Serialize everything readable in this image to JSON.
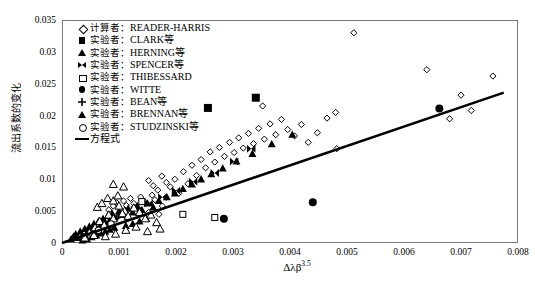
{
  "chart_data": {
    "type": "scatter",
    "title": "",
    "xlabel": "Δλβ",
    "xlabel_exponent": "3.5",
    "ylabel": "流出系数的变化",
    "xlim": [
      0,
      0.008
    ],
    "ylim": [
      0,
      0.035
    ],
    "xticks": [
      "0",
      "0.001",
      "0.002",
      "0.003",
      "0.004",
      "0.005",
      "0.006",
      "0.007",
      "0.008"
    ],
    "yticks": [
      "0",
      "0.005",
      "0.01",
      "0.015",
      "0.02",
      "0.025",
      "0.03",
      "0.035"
    ],
    "grid": false,
    "legend_position": "top-left-inside",
    "series": [
      {
        "name": "READER-HARRIS",
        "role_label": "计算者",
        "marker": "diamond-open",
        "points": [
          [
            0.00082,
            0.0052
          ],
          [
            0.0009,
            0.0058
          ],
          [
            0.00096,
            0.0063
          ],
          [
            0.00103,
            0.005
          ],
          [
            0.00108,
            0.0066
          ],
          [
            0.00113,
            0.0059
          ],
          [
            0.0012,
            0.007
          ],
          [
            0.00126,
            0.0062
          ],
          [
            0.00132,
            0.0055
          ],
          [
            0.00138,
            0.0072
          ],
          [
            0.00145,
            0.0065
          ],
          [
            0.00152,
            0.0048
          ],
          [
            0.00158,
            0.0075
          ],
          [
            0.00163,
            0.0068
          ],
          [
            0.0017,
            0.0045
          ],
          [
            0.00176,
            0.0058
          ],
          [
            0.00152,
            0.0098
          ],
          [
            0.0016,
            0.009
          ],
          [
            0.00168,
            0.0083
          ],
          [
            0.00175,
            0.0105
          ],
          [
            0.00183,
            0.0095
          ],
          [
            0.0019,
            0.0088
          ],
          [
            0.00198,
            0.01
          ],
          [
            0.00205,
            0.0078
          ],
          [
            0.00213,
            0.0112
          ],
          [
            0.00221,
            0.0093
          ],
          [
            0.00228,
            0.0122
          ],
          [
            0.00236,
            0.0106
          ],
          [
            0.00244,
            0.0131
          ],
          [
            0.00252,
            0.0118
          ],
          [
            0.0026,
            0.0143
          ],
          [
            0.00268,
            0.0127
          ],
          [
            0.00276,
            0.015
          ],
          [
            0.00285,
            0.0136
          ],
          [
            0.00294,
            0.0158
          ],
          [
            0.00302,
            0.0142
          ],
          [
            0.0031,
            0.0165
          ],
          [
            0.00318,
            0.0149
          ],
          [
            0.00327,
            0.0172
          ],
          [
            0.00336,
            0.0156
          ],
          [
            0.00345,
            0.018
          ],
          [
            0.00355,
            0.0163
          ],
          [
            0.00365,
            0.0187
          ],
          [
            0.00375,
            0.017
          ],
          [
            0.00385,
            0.0194
          ],
          [
            0.00396,
            0.0178
          ],
          [
            0.00408,
            0.0168
          ],
          [
            0.0042,
            0.0186
          ],
          [
            0.00432,
            0.0158
          ],
          [
            0.00448,
            0.0173
          ],
          [
            0.00465,
            0.0196
          ],
          [
            0.00482,
            0.0148
          ],
          [
            0.00512,
            0.033
          ],
          [
            0.0064,
            0.0272
          ],
          [
            0.0068,
            0.0195
          ],
          [
            0.007,
            0.0232
          ],
          [
            0.00718,
            0.0208
          ],
          [
            0.00756,
            0.0262
          ],
          [
            0.0048,
            0.0205
          ],
          [
            0.00352,
            0.0215
          ]
        ]
      },
      {
        "name": "CLARK等",
        "role_label": "实验者",
        "marker": "square-filled",
        "points": [
          [
            0.00256,
            0.0212
          ],
          [
            0.0034,
            0.0228
          ]
        ]
      },
      {
        "name": "HERNING等",
        "role_label": "实验者",
        "marker": "triangle-filled",
        "points": [
          [
            0.00016,
            0.0006
          ],
          [
            0.0002,
            0.001
          ],
          [
            0.00024,
            0.0014
          ],
          [
            0.00028,
            0.0008
          ],
          [
            0.00032,
            0.0018
          ],
          [
            0.00036,
            0.0012
          ],
          [
            0.0004,
            0.0022
          ],
          [
            0.00044,
            0.0016
          ],
          [
            0.00048,
            0.0026
          ],
          [
            0.00052,
            0.002
          ],
          [
            0.00056,
            0.003
          ],
          [
            0.0006,
            0.0024
          ],
          [
            0.00064,
            0.0034
          ],
          [
            0.00068,
            0.0028
          ],
          [
            0.00072,
            0.0038
          ],
          [
            0.00076,
            0.0032
          ],
          [
            0.0008,
            0.0042
          ],
          [
            0.00084,
            0.0036
          ],
          [
            0.00088,
            0.0046
          ],
          [
            0.00092,
            0.004
          ],
          [
            0.00036,
            0.0004
          ],
          [
            0.00044,
            0.0006
          ],
          [
            0.00052,
            0.0009
          ],
          [
            0.0006,
            0.0012
          ],
          [
            0.00068,
            0.0015
          ],
          [
            0.00076,
            0.0018
          ],
          [
            0.00084,
            0.0021
          ],
          [
            0.00092,
            0.0024
          ],
          [
            0.001,
            0.005
          ],
          [
            0.00108,
            0.0044
          ],
          [
            0.00116,
            0.0054
          ],
          [
            0.00124,
            0.0048
          ],
          [
            0.00132,
            0.0058
          ],
          [
            0.0014,
            0.0052
          ],
          [
            0.0015,
            0.0062
          ],
          [
            0.0016,
            0.0056
          ],
          [
            0.00112,
            0.0027
          ],
          [
            0.00124,
            0.003
          ],
          [
            0.00136,
            0.0034
          ],
          [
            0.00148,
            0.0038
          ],
          [
            0.0017,
            0.0066
          ],
          [
            0.00184,
            0.0072
          ],
          [
            0.00198,
            0.0078
          ],
          [
            0.00212,
            0.0085
          ],
          [
            0.00228,
            0.0092
          ],
          [
            0.00244,
            0.01
          ],
          [
            0.00262,
            0.0108
          ],
          [
            0.00282,
            0.0117
          ],
          [
            0.00306,
            0.0128
          ],
          [
            0.00334,
            0.014
          ],
          [
            0.00368,
            0.0155
          ],
          [
            0.00404,
            0.017
          ]
        ]
      },
      {
        "name": "SPENCER等",
        "role_label": "实验者",
        "marker": "bowtie-filled",
        "points": [
          [
            0.00105,
            0.0042
          ],
          [
            0.00128,
            0.0052
          ],
          [
            0.00152,
            0.0062
          ],
          [
            0.00176,
            0.0072
          ],
          [
            0.002,
            0.0082
          ],
          [
            0.0023,
            0.0096
          ],
          [
            0.00268,
            0.011
          ],
          [
            0.00302,
            0.0128
          ],
          [
            0.00332,
            0.0148
          ]
        ]
      },
      {
        "name": "THIBESSARD",
        "role_label": "实验者",
        "marker": "square-open",
        "points": [
          [
            0.0014,
            0.0065
          ],
          [
            0.00212,
            0.0045
          ],
          [
            0.00268,
            0.004
          ]
        ]
      },
      {
        "name": "WITTE",
        "role_label": "实验者",
        "marker": "circle-filled",
        "points": [
          [
            0.00284,
            0.0038
          ],
          [
            0.0044,
            0.0064
          ],
          [
            0.00662,
            0.0211
          ]
        ]
      },
      {
        "name": "BEAN等",
        "role_label": "实验者",
        "marker": "plus",
        "points": [
          [
            0.0005,
            0.0021
          ],
          [
            0.00072,
            0.003
          ],
          [
            0.00096,
            0.004
          ]
        ]
      },
      {
        "name": "BRENNAN等",
        "role_label": "实验者",
        "marker": "triangle-open",
        "points": [
          [
            0.00048,
            0.0016
          ],
          [
            0.00058,
            0.0024
          ],
          [
            0.00066,
            0.0034
          ],
          [
            0.00074,
            0.0028
          ],
          [
            0.00082,
            0.0044
          ],
          [
            0.0009,
            0.0038
          ],
          [
            0.00062,
            0.0056
          ],
          [
            0.0007,
            0.0062
          ],
          [
            0.0008,
            0.007
          ],
          [
            0.0009,
            0.0066
          ],
          [
            0.001,
            0.0058
          ],
          [
            0.0011,
            0.005
          ],
          [
            0.00098,
            0.0074
          ],
          [
            0.00106,
            0.0046
          ],
          [
            0.00116,
            0.0042
          ],
          [
            0.00126,
            0.0055
          ],
          [
            0.00136,
            0.0048
          ],
          [
            0.00146,
            0.0038
          ],
          [
            0.00156,
            0.0044
          ],
          [
            0.00166,
            0.0032
          ],
          [
            0.0004,
            0.0008
          ],
          [
            0.00056,
            0.0012
          ],
          [
            0.00076,
            0.001
          ],
          [
            0.00094,
            0.0014
          ],
          [
            0.00112,
            0.002
          ],
          [
            0.0013,
            0.0025
          ],
          [
            0.0015,
            0.0018
          ],
          [
            0.00172,
            0.0022
          ],
          [
            0.00108,
            0.0088
          ],
          [
            0.0009,
            0.0092
          ]
        ]
      },
      {
        "name": "STUDZINSKI等",
        "role_label": "实验者",
        "marker": "circle-open",
        "points": [
          [
            0.00064,
            0.002
          ],
          [
            0.00086,
            0.003
          ]
        ]
      },
      {
        "name": "方程式",
        "role_label": "",
        "marker": "line",
        "line": {
          "x0": 0.0,
          "y0": 0.0,
          "x1": 0.00775,
          "y1": 0.0236
        }
      }
    ]
  },
  "legend": {
    "items": [
      {
        "symbol": "diamond-open",
        "role": "计算者：",
        "name": "READER-HARRIS"
      },
      {
        "symbol": "square-filled",
        "role": "实验者：",
        "name": "CLARK等"
      },
      {
        "symbol": "triangle-filled",
        "role": "实验者：",
        "name": "HERNING等"
      },
      {
        "symbol": "bowtie-filled",
        "role": "实验者：",
        "name": "SPENCER等"
      },
      {
        "symbol": "square-open",
        "role": "实验者：",
        "name": "THIBESSARD"
      },
      {
        "symbol": "circle-filled",
        "role": "实验者：",
        "name": "WITTE"
      },
      {
        "symbol": "plus",
        "role": "实验者：",
        "name": "BEAN等"
      },
      {
        "symbol": "triangle-open",
        "role": "实验者：",
        "name": "BRENNAN等"
      },
      {
        "symbol": "circle-open",
        "role": "实验者：",
        "name": "STUDZINSKI等"
      },
      {
        "symbol": "line",
        "role": "",
        "name": "方程式"
      }
    ]
  },
  "colors": {
    "ink": "#000000",
    "frame": "#7a7a7a",
    "background": "#ffffff"
  }
}
